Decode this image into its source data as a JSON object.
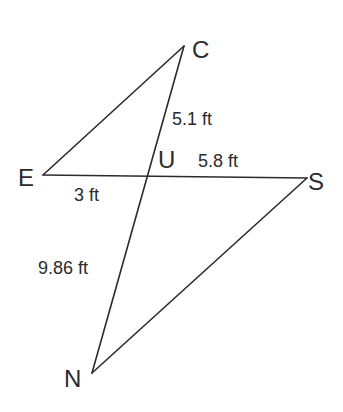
{
  "figure": {
    "type": "geometry",
    "vertices": {
      "C": {
        "label": "C",
        "x": 184,
        "y": 46,
        "label_x": 192,
        "label_y": 58
      },
      "E": {
        "label": "E",
        "x": 43,
        "y": 175,
        "label_x": 18,
        "label_y": 186
      },
      "S": {
        "label": "S",
        "x": 307,
        "y": 178,
        "label_x": 308,
        "label_y": 190
      },
      "N": {
        "label": "N",
        "x": 92,
        "y": 373,
        "label_x": 64,
        "label_y": 387
      },
      "U": {
        "label": "U",
        "x": 148,
        "y": 176,
        "label_x": 158,
        "label_y": 168
      }
    },
    "segments": [
      {
        "from": "E",
        "to": "C"
      },
      {
        "from": "C",
        "to": "N"
      },
      {
        "from": "E",
        "to": "S"
      },
      {
        "from": "S",
        "to": "N"
      }
    ],
    "measurements": [
      {
        "segment": "CU",
        "text": "5.1 ft",
        "x": 172,
        "y": 125
      },
      {
        "segment": "US",
        "text": "5.8 ft",
        "x": 198,
        "y": 167
      },
      {
        "segment": "EU",
        "text": "3 ft",
        "x": 74,
        "y": 201
      },
      {
        "segment": "UN",
        "text": "9.86 ft",
        "x": 38,
        "y": 274
      }
    ]
  }
}
